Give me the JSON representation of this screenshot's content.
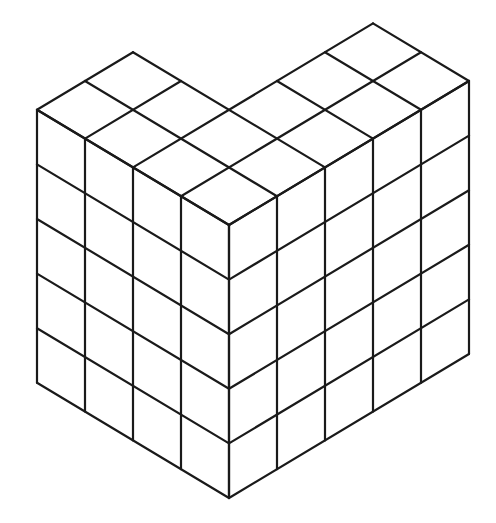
{
  "diagram": {
    "type": "isometric-cube-stack",
    "line_color": "#1a1a1a",
    "background": "#ffffff",
    "geometry": {
      "front_bottom_corner": [
        229,
        498
      ],
      "unit_dx": 48,
      "unit_dy": 28.8,
      "unit_height": 54.6
    },
    "structure": {
      "height_layers": 5,
      "left_face_columns": 4,
      "right_face_columns": 5,
      "left_arm": {
        "length": 4,
        "depth": 2
      },
      "right_arm": {
        "length": 5,
        "depth": 2
      },
      "total_cubes": 80
    }
  }
}
